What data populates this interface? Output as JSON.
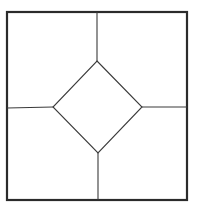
{
  "diagram": {
    "type": "geometric-figure",
    "colors": {
      "background": "#ffffff",
      "stroke": "#2b2b2b"
    },
    "outer_square": {
      "x1": 7,
      "y1": 12,
      "x2": 187,
      "y2": 200
    },
    "diamond": {
      "top": [
        97,
        61
      ],
      "right": [
        142,
        107
      ],
      "bottom": [
        98,
        153
      ],
      "left": [
        53,
        107
      ]
    },
    "connectors": [
      {
        "name": "top",
        "from": [
          97,
          12
        ],
        "to": [
          97,
          61
        ]
      },
      {
        "name": "right",
        "from": [
          142,
          107
        ],
        "to": [
          187,
          107
        ]
      },
      {
        "name": "bottom",
        "from": [
          98,
          153
        ],
        "to": [
          98,
          200
        ]
      },
      {
        "name": "left",
        "from": [
          7,
          108
        ],
        "to": [
          53,
          107
        ]
      }
    ],
    "regions": 5
  }
}
